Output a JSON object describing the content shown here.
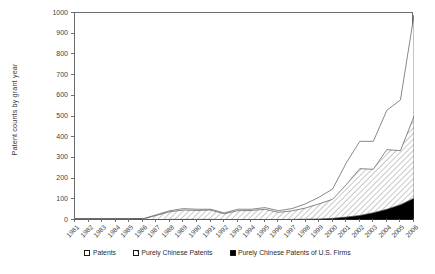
{
  "chart_data": {
    "type": "area",
    "title": "",
    "xlabel": "",
    "ylabel": "Patent counts by grant year",
    "stacked": true,
    "grid": false,
    "legend_position": "bottom",
    "xlim": [
      1981,
      2006
    ],
    "ylim": [
      0,
      1000
    ],
    "ytick_labels": [
      "0",
      "100",
      "200",
      "300",
      "400",
      "500",
      "600",
      "700",
      "800",
      "900",
      "1000"
    ],
    "ytick_values": [
      0,
      100,
      200,
      300,
      400,
      500,
      600,
      700,
      800,
      900,
      1000
    ],
    "categories": [
      1981,
      1982,
      1983,
      1984,
      1985,
      1986,
      1987,
      1988,
      1989,
      1990,
      1991,
      1992,
      1993,
      1994,
      1995,
      1996,
      1997,
      1998,
      1999,
      2000,
      2001,
      2002,
      2003,
      2004,
      2005,
      2006
    ],
    "xtick_labels": [
      "1981",
      "1982",
      "1983",
      "1984",
      "1985",
      "1986",
      "1987",
      "1988",
      "1989",
      "1990",
      "1991",
      "1992",
      "1993",
      "1994",
      "1995",
      "1996",
      "1997",
      "1998",
      "1999",
      "2000",
      "2001",
      "2002",
      "2003",
      "2004",
      "2005",
      "2006"
    ],
    "series": [
      {
        "name": "Purely Chinese Patents of U.S. Firms",
        "fill": "solid-black",
        "color": "#000000",
        "values": [
          0,
          0,
          0,
          0,
          0,
          1,
          2,
          3,
          3,
          3,
          3,
          2,
          2,
          2,
          2,
          2,
          3,
          4,
          5,
          8,
          14,
          22,
          35,
          52,
          74,
          105
        ]
      },
      {
        "name": "Purely Chinese Patents",
        "fill": "hatched",
        "color": "#e8e8e8",
        "values": [
          0,
          0,
          0,
          0,
          1,
          5,
          22,
          40,
          48,
          46,
          48,
          30,
          45,
          46,
          52,
          37,
          44,
          58,
          78,
          100,
          170,
          248,
          245,
          340,
          335,
          500
        ]
      },
      {
        "name": "Patents",
        "fill": "white",
        "color": "#ffffff",
        "values": [
          0,
          0,
          0,
          0,
          1,
          6,
          25,
          45,
          55,
          52,
          52,
          34,
          52,
          52,
          60,
          45,
          55,
          78,
          110,
          150,
          275,
          380,
          380,
          530,
          580,
          990
        ]
      }
    ],
    "series_cumulative_note": "Series values are cumulative stacked tops read off the axis"
  },
  "legend": {
    "items": [
      {
        "label": "Patents",
        "swatch": "white-square-icon"
      },
      {
        "label": "Purely Chinese Patents",
        "swatch": "hatched-square-icon"
      },
      {
        "label": "Purely Chinese Patents of U.S. Firms",
        "swatch": "black-square-icon"
      }
    ]
  }
}
